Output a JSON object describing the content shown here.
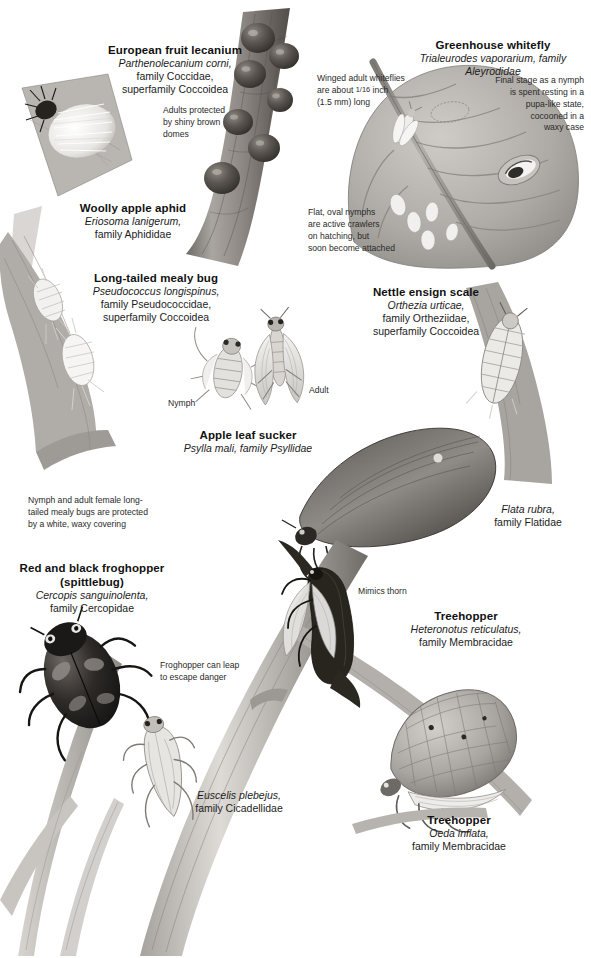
{
  "page": {
    "background_color": "#ffffff",
    "ink_color": "#1a1a1a"
  },
  "specimens": [
    {
      "id": "european-fruit-lecanium",
      "common_name": "European fruit lecanium",
      "scientific_name": "Parthenolecanium corni,",
      "family": "family Coccidae,",
      "superfamily": "superfamily Coccoidea"
    },
    {
      "id": "greenhouse-whitefly",
      "common_name": "Greenhouse whitefly",
      "scientific_name": "Trialeurodes vaporarium, family Aleyrodidae",
      "family": "",
      "superfamily": ""
    },
    {
      "id": "woolly-apple-aphid",
      "common_name": "Woolly apple aphid",
      "scientific_name": "Eriosoma lanigerum,",
      "family": "family Aphididae",
      "superfamily": ""
    },
    {
      "id": "long-tailed-mealy-bug",
      "common_name": "Long-tailed mealy bug",
      "scientific_name": "Pseudococcus longispinus,",
      "family": "family Pseudococcidae,",
      "superfamily": "superfamily Coccoidea"
    },
    {
      "id": "nettle-ensign-scale",
      "common_name": "Nettle ensign scale",
      "scientific_name": "Orthezia urticae,",
      "family": "family Ortheziidae,",
      "superfamily": "superfamily Coccoidea"
    },
    {
      "id": "apple-leaf-sucker",
      "common_name": "Apple leaf sucker",
      "scientific_name": "Psylla mali, family Psyllidae",
      "family": "",
      "superfamily": ""
    },
    {
      "id": "flata-rubra",
      "common_name": "",
      "scientific_name": "Flata rubra,",
      "family": "family Flatidae",
      "superfamily": ""
    },
    {
      "id": "red-and-black-froghopper",
      "common_name": "Red and black froghopper",
      "common_name_line2": "(spittlebug)",
      "scientific_name": "Cercopis sanguinolenta,",
      "family": "family Cercopidae",
      "superfamily": ""
    },
    {
      "id": "treehopper-heteronotus",
      "common_name": "Treehopper",
      "scientific_name": "Heteronotus reticulatus,",
      "family": "family Membracidae",
      "superfamily": ""
    },
    {
      "id": "euscelis-plebejus",
      "common_name": "",
      "scientific_name": "Euscelis plebejus,",
      "family": "family Cicadellidae",
      "superfamily": ""
    },
    {
      "id": "treehopper-oeda",
      "common_name": "Treehopper",
      "scientific_name": "Oeda inflata,",
      "family": "family Membracidae",
      "superfamily": ""
    }
  ],
  "annotations": {
    "lecanium_domes": "Adults protected\nby shiny brown\ndomes",
    "whitefly_size_pre": "Winged adult whiteflies",
    "whitefly_size_mid": "are about",
    "whitefly_size_fraction": "1/16",
    "whitefly_size_post": "inch",
    "whitefly_size_metric": "(1.5 mm) long",
    "whitefly_nymph_stage": "Final stage as a nymph\nis spent resting in a\npupa-like state,\ncocooned in a\nwaxy case",
    "whitefly_crawlers": "Flat, oval nymphs\nare active crawlers\non hatching, but\nsoon become attached",
    "mealybug_wax": "Nymph and adult female long-\ntailed mealy bugs are protected\nby a white, waxy covering",
    "mimics_thorn": "Mimics thorn",
    "froghopper_leap": "Froghopper can leap\nto escape danger",
    "psyllid_nymph": "Nymph",
    "psyllid_adult": "Adult"
  }
}
